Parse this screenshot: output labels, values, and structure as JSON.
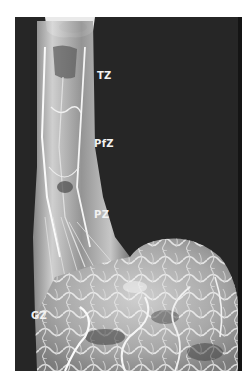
{
  "figure": {
    "background_color": "#262626",
    "cast_color": "#e8e8e8",
    "labels": [
      {
        "id": "tz",
        "text": "TZ",
        "x": 97,
        "y": 71
      },
      {
        "id": "pfz",
        "text": "PfZ",
        "x": 94,
        "y": 139
      },
      {
        "id": "pz",
        "text": "PZ",
        "x": 94,
        "y": 210
      },
      {
        "id": "gz",
        "text": "GZ",
        "x": 31,
        "y": 311
      }
    ]
  }
}
